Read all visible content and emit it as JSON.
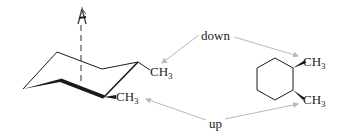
{
  "diagram": {
    "type": "chemistry-conformation",
    "chair": {
      "viewing_icon": "eye-icon",
      "substituents": [
        {
          "label_main": "CH",
          "label_sub": "3",
          "position": "upper-right"
        },
        {
          "label_main": "CH",
          "label_sub": "3",
          "position": "lower-right"
        }
      ]
    },
    "annotations": {
      "down": "down",
      "up": "up"
    },
    "haworth": {
      "substituents": [
        {
          "label_main": "CH",
          "label_sub": "3",
          "position": "top",
          "bond": "wedge"
        },
        {
          "label_main": "CH",
          "label_sub": "3",
          "position": "bottom",
          "bond": "wedge"
        }
      ]
    },
    "colors": {
      "ink": "#1a1a1a",
      "arrow": "#b8b8b8",
      "dash": "#777777"
    }
  }
}
